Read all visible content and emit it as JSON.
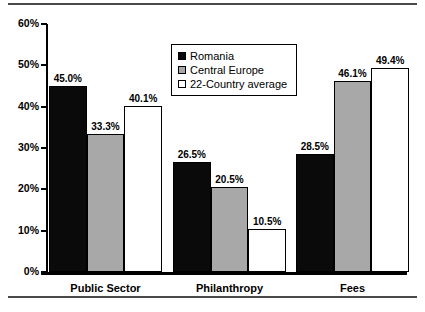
{
  "chart_data": {
    "type": "bar",
    "title": "",
    "xlabel": "",
    "ylabel": "",
    "ylim": [
      0,
      60
    ],
    "ytick_labels": [
      "0%",
      "10%",
      "20%",
      "30%",
      "40%",
      "50%",
      "60%"
    ],
    "ytick_values": [
      0,
      10,
      20,
      30,
      40,
      50,
      60
    ],
    "grid": false,
    "legend_position": "upper center",
    "categories": [
      "Public Sector",
      "Philanthropy",
      "Fees"
    ],
    "series": [
      {
        "name": "Romania",
        "values": [
          45.0,
          26.5,
          28.5
        ],
        "labels": [
          "45.0%",
          "26.5%",
          "28.5%"
        ],
        "color": "#0a0a0a"
      },
      {
        "name": "Central Europe",
        "values": [
          33.3,
          20.5,
          46.1
        ],
        "labels": [
          "33.3%",
          "20.5%",
          "46.1%"
        ],
        "color": "#a8a8a8"
      },
      {
        "name": "22-Country average",
        "values": [
          40.1,
          10.5,
          49.4
        ],
        "labels": [
          "40.1%",
          "10.5%",
          "49.4%"
        ],
        "color": "#ffffff"
      }
    ]
  }
}
